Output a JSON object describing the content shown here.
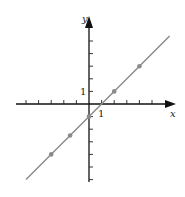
{
  "chart_data": {
    "type": "line",
    "title": "",
    "xlabel": "x",
    "ylabel": "y",
    "equation": "y = x - 1",
    "x_tick_label": "1",
    "y_tick_label": "1",
    "xlim": [
      -7,
      6.5
    ],
    "ylim": [
      -6,
      6
    ],
    "grid": false,
    "series": [
      {
        "name": "line",
        "points": [
          [
            -5,
            -6
          ],
          [
            6.4,
            5.4
          ]
        ],
        "color": "#8a8a8a"
      },
      {
        "name": "marked points",
        "type": "scatter",
        "points": [
          [
            -3,
            -4
          ],
          [
            -1.5,
            -2.5
          ],
          [
            0,
            -1
          ],
          [
            2,
            1
          ],
          [
            4,
            3
          ]
        ],
        "color": "#8a8a8a"
      }
    ],
    "x_ticks": [
      -5,
      -4,
      -3,
      -2,
      -1,
      1,
      2,
      3,
      4,
      5
    ],
    "y_ticks": [
      -6,
      -5,
      -4,
      -3,
      -2,
      -1,
      1,
      2,
      3,
      4,
      5
    ]
  },
  "axes": {
    "x_label": "x",
    "y_label": "y",
    "x_one": "1",
    "y_one": "1"
  }
}
